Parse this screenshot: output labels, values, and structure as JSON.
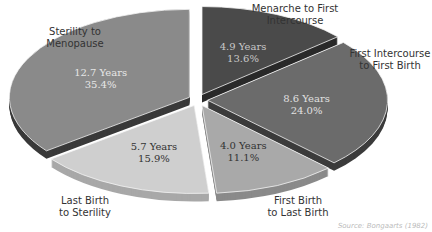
{
  "chart_data": {
    "type": "pie",
    "title": "",
    "style": "3d-exploded",
    "start_angle": "12 o'clock",
    "direction": "clockwise",
    "categories": [
      "Menarche to First Intercourse",
      "First Intercourse to First Birth",
      "First Birth to Last Birth",
      "Last Birth to Sterility",
      "Sterility to Menopause"
    ],
    "values": [
      13.6,
      24.0,
      11.1,
      15.9,
      35.4
    ],
    "years": [
      4.9,
      8.6,
      4.0,
      5.7,
      12.7
    ],
    "slices": [
      {
        "label": "Menarche to First\nIntercourse",
        "years_text": "4.9 Years",
        "pct_text": "13.6%",
        "pct": 13.6,
        "color": "#4a4a4a",
        "side": "#2a2a2a",
        "text_color": "#c8c8c8"
      },
      {
        "label": "First Intercourse\nto First Birth",
        "years_text": "8.6 Years",
        "pct_text": "24.0%",
        "pct": 24.0,
        "color": "#6b6b6b",
        "side": "#3c3c3c",
        "text_color": "#e0e0e0"
      },
      {
        "label": "First Birth\nto Last Birth",
        "years_text": "4.0 Years",
        "pct_text": "11.1%",
        "pct": 11.1,
        "color": "#a9a9a9",
        "side": "#8a8a8a",
        "text_color": "#333333"
      },
      {
        "label": "Last Birth\nto Sterility",
        "years_text": "5.7 Years",
        "pct_text": "15.9%",
        "pct": 15.9,
        "color": "#cfcfcf",
        "side": "#a8a8a8",
        "text_color": "#333333"
      },
      {
        "label": "Sterility to\nMenopause",
        "years_text": "12.7 Years",
        "pct_text": "35.4%",
        "pct": 35.4,
        "color": "#8a8a8a",
        "side": "#3a3a3a",
        "text_color": "#e6e6e6"
      }
    ],
    "legend": "none (labels placed outside slices)"
  },
  "labels": {
    "menarche": "Menarche to First\nIntercourse",
    "first_intercourse": "First Intercourse\nto First Birth",
    "first_birth": "First Birth\nto Last Birth",
    "last_birth": "Last Birth\nto Sterility",
    "sterility": "Sterility to\nMenopause"
  },
  "source": "Source: Bongaarts (1982)"
}
